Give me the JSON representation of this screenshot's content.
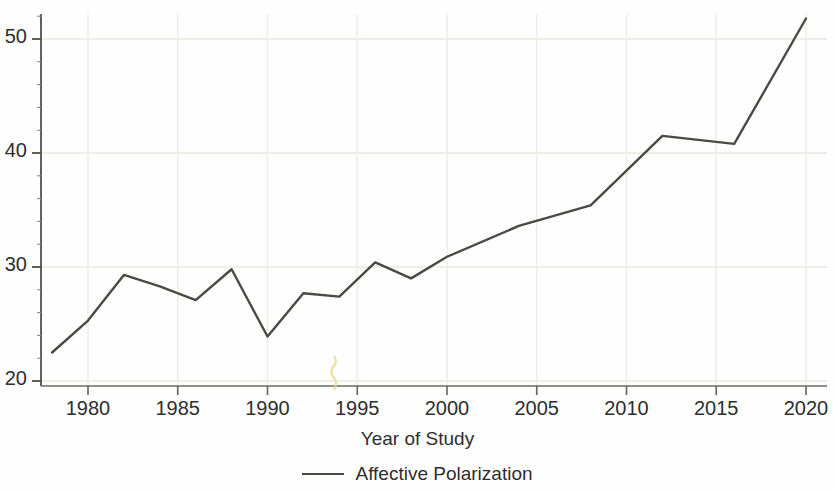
{
  "chart_data": {
    "type": "line",
    "title": "",
    "subtitle": "",
    "xlabel": "Year of Study",
    "ylabel": "",
    "xlim": [
      1977.0,
      2021.2
    ],
    "ylim": [
      19.0,
      53.0
    ],
    "grid": true,
    "grid_style": "faint horizontal and vertical gridlines at major ticks",
    "legend_position": "bottom-center",
    "x_ticks": [
      1980,
      1985,
      1990,
      1995,
      2000,
      2005,
      2010,
      2015,
      2020
    ],
    "x_tick_labels": [
      "1980",
      "1985",
      "1990",
      "1995",
      "2000",
      "2005",
      "2010",
      "2015",
      "2020"
    ],
    "x_minor_ticks": [
      1978,
      1982,
      1984,
      1986,
      1988,
      1992,
      1994,
      1996,
      1998,
      2002,
      2004,
      2006,
      2008,
      2012,
      2014,
      2016,
      2018
    ],
    "y_ticks": [
      20,
      30,
      40,
      50
    ],
    "y_tick_labels": [
      "20",
      "30",
      "40",
      "50"
    ],
    "y_minor_ticks": [
      22,
      24,
      26,
      28,
      32,
      34,
      36,
      38,
      42,
      44,
      46,
      48,
      52
    ],
    "line_color": "#4a4a42",
    "line_width": 2.4,
    "series": [
      {
        "name": "Affective Polarization",
        "x": [
          1978,
          1980,
          1982,
          1984,
          1986,
          1988,
          1990,
          1992,
          1994,
          1996,
          1998,
          2000,
          2004,
          2008,
          2012,
          2016,
          2020
        ],
        "values": [
          22.5,
          25.3,
          29.3,
          28.3,
          27.1,
          29.8,
          23.9,
          27.7,
          27.4,
          30.4,
          29.0,
          30.9,
          33.6,
          35.4,
          41.5,
          40.8,
          51.8
        ]
      }
    ]
  },
  "legend": {
    "entries": [
      {
        "label": "Affective Polarization",
        "color": "#4a4a42"
      }
    ]
  },
  "axes": {
    "x_title": "Year of Study"
  }
}
